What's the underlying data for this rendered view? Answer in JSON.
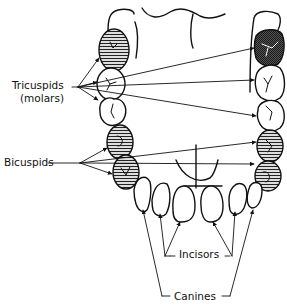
{
  "diagram": {
    "type": "dental-arch-illustration",
    "labels": {
      "tricuspids": "Tricuspids",
      "tricuspids_sub": "(molars)",
      "bicuspids": "Bicuspids",
      "incisors": "Incisors",
      "canines": "Canines"
    },
    "tooth_groups": [
      {
        "name": "Tricuspids (molars)",
        "count_per_side": 3,
        "left_fill": [
          "hatched",
          "white",
          "white"
        ],
        "right_fill": [
          "dark-hatched",
          "white",
          "white"
        ]
      },
      {
        "name": "Bicuspids",
        "count_per_side": 2,
        "fill": "hatched"
      },
      {
        "name": "Canines",
        "count_per_side": 1,
        "fill": "white"
      },
      {
        "name": "Incisors",
        "count_per_side": 2,
        "fill": "white"
      }
    ],
    "colors": {
      "line": "#111111",
      "hatch": "#222222",
      "background": "#ffffff"
    }
  }
}
